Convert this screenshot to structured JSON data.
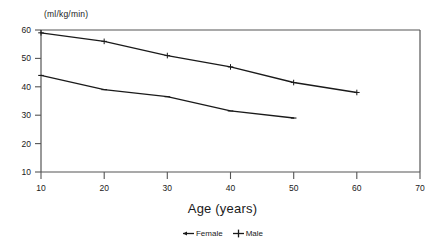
{
  "chart_data": {
    "type": "line",
    "title": "",
    "xlabel": "Age (years)",
    "ylabel": "(ml/kg/min)",
    "xlim": [
      10,
      70
    ],
    "ylim": [
      10,
      60
    ],
    "xticks": [
      10,
      20,
      30,
      40,
      50,
      60,
      70
    ],
    "yticks": [
      10,
      20,
      30,
      40,
      50,
      60
    ],
    "grid": false,
    "legend_position": "below-axis-title",
    "series": [
      {
        "name": "Female",
        "marker": "dash",
        "color": "#1a1a1a",
        "x": [
          10,
          20,
          30,
          40,
          50
        ],
        "values": [
          44,
          39,
          36.5,
          31.5,
          29
        ]
      },
      {
        "name": "Male",
        "marker": "plus",
        "color": "#1a1a1a",
        "x": [
          10,
          20,
          30,
          40,
          50,
          60
        ],
        "values": [
          59,
          56,
          51,
          47,
          41.5,
          38
        ]
      }
    ]
  },
  "axes": {
    "y_unit": "(ml/kg/min)",
    "x_title": "Age (years)",
    "y_tick_labels": [
      "60",
      "50",
      "40",
      "30",
      "20",
      "10"
    ],
    "x_tick_labels": [
      "10",
      "20",
      "30",
      "40",
      "50",
      "60",
      "70"
    ]
  },
  "legend": {
    "items": [
      {
        "label": "Female",
        "marker": "dash-marker"
      },
      {
        "label": "Male",
        "marker": "plus-marker"
      }
    ]
  },
  "colors": {
    "line": "#1a1a1a",
    "axis": "#555555",
    "background": "#ffffff"
  }
}
